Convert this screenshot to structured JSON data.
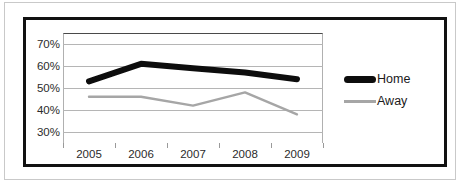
{
  "chart_data": {
    "type": "line",
    "title": "",
    "subtitle": "",
    "xlabel": "",
    "ylabel": "",
    "categories": [
      "2005",
      "2006",
      "2007",
      "2008",
      "2009"
    ],
    "ytick_labels": [
      "30%",
      "40%",
      "50%",
      "60%",
      "70%"
    ],
    "ytick_values": [
      30,
      40,
      50,
      60,
      70
    ],
    "ylim": [
      25,
      75
    ],
    "grid": "horizontal",
    "legend_position": "right",
    "series": [
      {
        "name": "Home",
        "values": [
          53,
          61,
          59,
          57,
          54
        ],
        "color": "#0d0d0d",
        "line_width": 6
      },
      {
        "name": "Away",
        "values": [
          46,
          46,
          42,
          48,
          38
        ],
        "color": "#a6a6a6",
        "line_width": 2.4
      }
    ]
  },
  "legend": {
    "entries": [
      {
        "label": "Home",
        "swatch": "thick-black-line"
      },
      {
        "label": "Away",
        "swatch": "thin-grey-line"
      }
    ]
  }
}
